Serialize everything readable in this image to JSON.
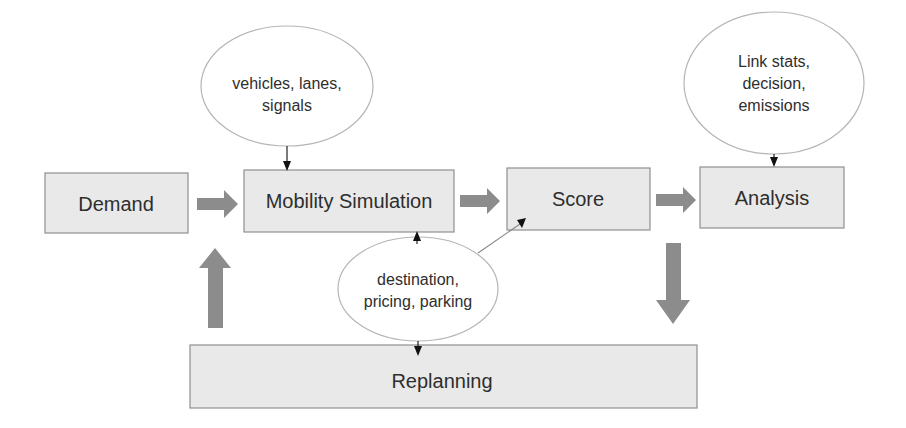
{
  "diagram": {
    "nodes": {
      "demand": {
        "label": "Demand"
      },
      "mobility_simulation": {
        "label": "Mobility Simulation"
      },
      "score": {
        "label": "Score"
      },
      "analysis": {
        "label": "Analysis"
      },
      "replanning": {
        "label": "Replanning"
      }
    },
    "inputs": {
      "network": {
        "lines": [
          "vehicles, lanes,",
          "signals"
        ]
      },
      "analysis_outputs": {
        "lines": [
          "Link stats,",
          "decision,",
          "emissions"
        ]
      },
      "choices": {
        "lines": [
          "destination,",
          "pricing, parking"
        ]
      }
    },
    "edges": [
      {
        "from": "Demand",
        "to": "Mobility Simulation",
        "style": "thick"
      },
      {
        "from": "Mobility Simulation",
        "to": "Score",
        "style": "thick"
      },
      {
        "from": "Score",
        "to": "Analysis",
        "style": "thick"
      },
      {
        "from": "Score",
        "to": "Replanning",
        "style": "thick-down"
      },
      {
        "from": "Replanning",
        "to": "Mobility Simulation",
        "style": "thick-up"
      },
      {
        "from": "vehicles, lanes, signals",
        "to": "Mobility Simulation",
        "style": "thin"
      },
      {
        "from": "Link stats, decision, emissions",
        "to": "Analysis",
        "style": "thin"
      },
      {
        "from": "destination, pricing, parking",
        "to": "Mobility Simulation",
        "style": "thin"
      },
      {
        "from": "destination, pricing, parking",
        "to": "Score",
        "style": "thin"
      },
      {
        "from": "destination, pricing, parking",
        "to": "Replanning",
        "style": "thin"
      }
    ]
  }
}
